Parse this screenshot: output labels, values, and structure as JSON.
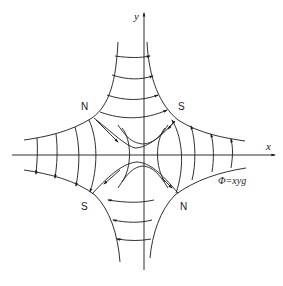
{
  "diagram": {
    "axes": {
      "x_label": "x",
      "y_label": "y"
    },
    "pole_labels": {
      "top_left": "N",
      "top_right": "S",
      "bottom_left": "S",
      "bottom_right": "N"
    },
    "equipotential_label": "Φ=xyg",
    "colors": {
      "stroke": "#1a1a1a",
      "background": "#ffffff"
    }
  }
}
